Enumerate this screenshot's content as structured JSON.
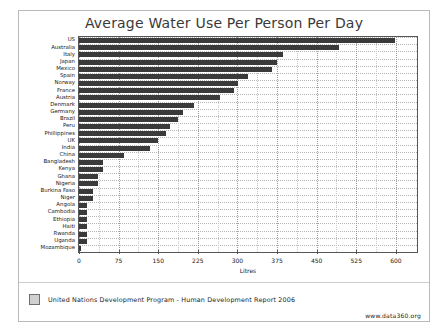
{
  "chart_data": {
    "type": "bar",
    "orientation": "horizontal",
    "title": "Average Water Use Per Person Per Day",
    "xlabel": "Litres",
    "ylabel": "",
    "xlim": [
      0,
      640
    ],
    "xticks": [
      0,
      75,
      150,
      225,
      300,
      375,
      450,
      525,
      600
    ],
    "xtick_labels": [
      "0",
      "75",
      "150",
      "225",
      "300",
      "375",
      "450",
      "525",
      "600"
    ],
    "grid": true,
    "legend_position": "bottom-left",
    "legend": [
      "United Nations Development Program - Human Development Report 2006"
    ],
    "bar_color": "#3a3a3a",
    "categories": [
      "US",
      "Australia",
      "Italy",
      "Japan",
      "Mexico",
      "Spain",
      "Norway",
      "France",
      "Austria",
      "Denmark",
      "Germany",
      "Brazil",
      "Peru",
      "Phillippines",
      "UK",
      "India",
      "China",
      "Bangladesh",
      "Kenya",
      "Ghana",
      "Nigeria",
      "Burkina Faso",
      "Niger",
      "Angola",
      "Cambodia",
      "Ethiopia",
      "Haiti",
      "Rwanda",
      "Uganda",
      "Mozambique"
    ],
    "values": [
      598,
      493,
      386,
      374,
      366,
      320,
      301,
      294,
      267,
      217,
      196,
      188,
      173,
      164,
      149,
      135,
      86,
      46,
      46,
      36,
      36,
      27,
      27,
      15,
      15,
      15,
      15,
      15,
      15,
      4
    ]
  },
  "footer": {
    "source_label": "United Nations Development Program - Human Development Report 2006",
    "site": "www.data360.org"
  }
}
